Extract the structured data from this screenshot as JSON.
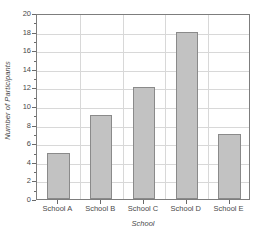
{
  "chart_data": {
    "type": "bar",
    "title": "",
    "categories": [
      "School A",
      "School B",
      "School C",
      "School D",
      "School E"
    ],
    "values": [
      5,
      9,
      12,
      18,
      7
    ],
    "series": [
      {
        "name": "Number of Participants",
        "values": [
          5,
          9,
          12,
          18,
          7
        ]
      }
    ],
    "xlabel": "School",
    "ylabel": "Number of Participants",
    "ylim": [
      0,
      20
    ],
    "ytick_step": 2,
    "yticks": [
      0,
      2,
      4,
      6,
      8,
      10,
      12,
      14,
      16,
      18,
      20
    ],
    "ytick_labels": [
      "0",
      "2",
      "4",
      "6",
      "8",
      "10",
      "12",
      "14",
      "16",
      "18",
      "20"
    ],
    "grid": "both",
    "legend": "none",
    "bar_fill_color": "#c2c2c2",
    "bar_edge_color": "#8a8a8a",
    "gridline_color": "#d8d8d8",
    "axis_color": "#7d7d7d",
    "text_color": "#4a4a4a",
    "background_color": "#ffffff"
  }
}
